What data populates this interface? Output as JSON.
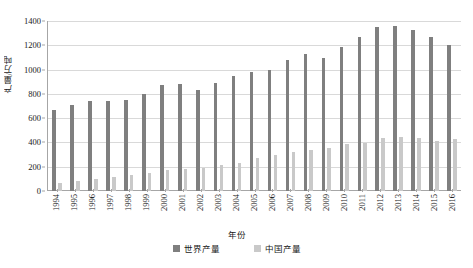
{
  "chart_data": {
    "type": "bar",
    "title": "",
    "subtitle": "",
    "xlabel": "年份",
    "ylabel": "产量/万吨",
    "ylim": [
      0,
      1400
    ],
    "ytick_step": 200,
    "ytick_labels": [
      "0",
      "200",
      "400",
      "600",
      "800",
      "1000",
      "1200",
      "1400"
    ],
    "grid": true,
    "grid_axis": "y",
    "legend_position": "bottom",
    "bar_mode": "grouped",
    "categories": [
      "1994",
      "1995",
      "1996",
      "1997",
      "1998",
      "1999",
      "2000",
      "2001",
      "2002",
      "2003",
      "2004",
      "2005",
      "2006",
      "2007",
      "2008",
      "2009",
      "2010",
      "2011",
      "2012",
      "2013",
      "2014",
      "2015",
      "2016"
    ],
    "series": [
      {
        "name": "世界产量",
        "color": "#7f7f7f",
        "values": [
          670,
          705,
          745,
          745,
          750,
          800,
          870,
          880,
          830,
          890,
          950,
          980,
          1000,
          1075,
          1130,
          1095,
          1185,
          1265,
          1350,
          1355,
          1330,
          1265,
          1200
        ]
      },
      {
        "name": "中国产量",
        "color": "#c9c9c9",
        "values": [
          65,
          80,
          95,
          115,
          130,
          150,
          170,
          180,
          190,
          215,
          230,
          270,
          300,
          320,
          340,
          355,
          385,
          395,
          435,
          445,
          440,
          410,
          430
        ]
      }
    ]
  },
  "legend": {
    "items": [
      {
        "label": "世界产量",
        "color": "#7f7f7f"
      },
      {
        "label": "中国产量",
        "color": "#c9c9c9"
      }
    ]
  },
  "colors": {
    "world_bar": "#7f7f7f",
    "china_bar": "#c9c9c9",
    "gridline": "#d9d9d9",
    "axis": "#a6a6a6",
    "text": "#1a1a1a",
    "background": "#ffffff"
  }
}
